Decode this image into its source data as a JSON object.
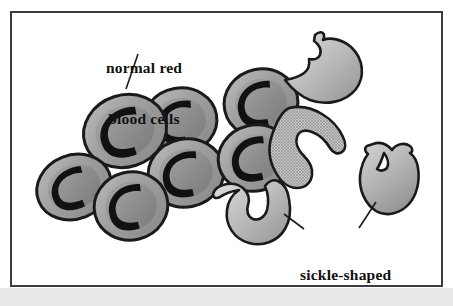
{
  "figure": {
    "background_color": "#ffffff",
    "frame_color": "#3b3b41",
    "bottom_band_color": "#e9e9e9"
  },
  "labels": {
    "normal": {
      "name": "normal red blood cells",
      "line1": "normal red",
      "line2": "blood cells"
    },
    "sickle": {
      "name": "sickle-shaped red blood cells",
      "line1": "sickle-shaped",
      "line2": "red blood cells"
    }
  },
  "colors": {
    "cell_outline": "#1a1a1a",
    "normal_cell_rim": "#9a9a9a",
    "normal_cell_rim_light": "#b9b9b9",
    "normal_cell_center": "#8c8c8c",
    "normal_cell_dimple": "#111111",
    "sickle_fill_light": "#d2d2d2",
    "sickle_fill_dark": "#9d9d9d",
    "sickle_textured": "#b0b0b0",
    "leader_line": "#1a1a1a"
  },
  "cells": {
    "normal": [
      {
        "id": "normal-cell-1",
        "cx": 112,
        "cy": 118,
        "rx": 41,
        "ry": 35,
        "rot": -18
      },
      {
        "id": "normal-cell-2",
        "cx": 168,
        "cy": 108,
        "rx": 37,
        "ry": 33,
        "rot": -10
      },
      {
        "id": "normal-cell-3",
        "cx": 172,
        "cy": 160,
        "rx": 38,
        "ry": 34,
        "rot": -12
      },
      {
        "id": "normal-cell-4",
        "cx": 62,
        "cy": 173,
        "rx": 37,
        "ry": 31,
        "rot": -22
      },
      {
        "id": "normal-cell-5",
        "cx": 118,
        "cy": 192,
        "rx": 36,
        "ry": 33,
        "rot": -14
      },
      {
        "id": "normal-cell-6",
        "cx": 248,
        "cy": 90,
        "rx": 37,
        "ry": 34,
        "rot": -12
      },
      {
        "id": "normal-cell-7",
        "cx": 242,
        "cy": 144,
        "rx": 37,
        "ry": 32,
        "rot": -14
      }
    ],
    "sickle": [
      {
        "id": "sickle-cell-top-right",
        "textured": false
      },
      {
        "id": "sickle-cell-middle-textured",
        "textured": true
      },
      {
        "id": "sickle-cell-right",
        "textured": false
      },
      {
        "id": "sickle-cell-bottom",
        "textured": false
      }
    ]
  },
  "leader_lines": [
    {
      "id": "leader-normal",
      "x1": 134,
      "y1": 51,
      "x2": 122,
      "y2": 84
    },
    {
      "id": "leader-sickle-bottom",
      "x1": 280,
      "y1": 211,
      "x2": 300,
      "y2": 226
    },
    {
      "id": "leader-sickle-right",
      "x1": 372,
      "y1": 199,
      "x2": 355,
      "y2": 225
    }
  ],
  "counts": {
    "normal_cells": 7,
    "sickle_cells": 4
  }
}
